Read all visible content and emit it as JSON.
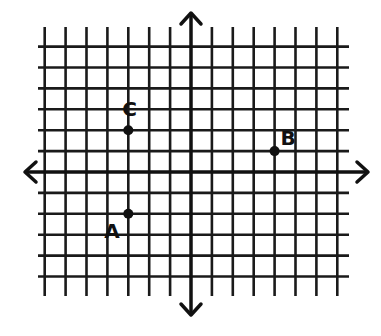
{
  "diagram": {
    "type": "coordinate-plane",
    "grid": {
      "x_min": -7,
      "x_max": 7,
      "y_min": -5,
      "y_max": 6,
      "line_color": "#1a1a1a",
      "axis_color": "#111111"
    },
    "axes": {
      "x_arrows": true,
      "y_arrows": true
    },
    "points": [
      {
        "label": "A",
        "x": -3,
        "y": -2
      },
      {
        "label": "B",
        "x": 4,
        "y": 1
      },
      {
        "label": "C",
        "x": -3,
        "y": 2
      }
    ]
  }
}
